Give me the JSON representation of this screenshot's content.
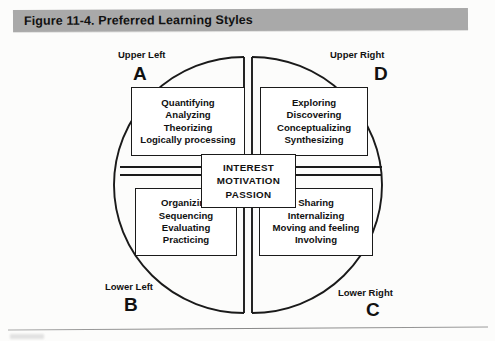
{
  "figure": {
    "title": "Figure 11-4. Preferred Learning Styles",
    "banner_color": "#a9a9a9",
    "background_color": "#fcfcfb",
    "ink_color": "#1a1a1a"
  },
  "diagram": {
    "type": "quadrant-circle",
    "shape": "circle divided into four quadrants by a double-line cross",
    "center": {
      "name": "center-box",
      "lines": [
        "INTEREST",
        "MOTIVATION",
        "PASSION"
      ]
    },
    "quadrants": [
      {
        "id": "A",
        "position": "upper-left",
        "position_label": "Upper Left",
        "letter": "A",
        "lines": [
          "Quantifying",
          "Analyzing",
          "Theorizing",
          "Logically processing"
        ]
      },
      {
        "id": "D",
        "position": "upper-right",
        "position_label": "Upper Right",
        "letter": "D",
        "lines": [
          "Exploring",
          "Discovering",
          "Conceptualizing",
          "Synthesizing"
        ]
      },
      {
        "id": "B",
        "position": "lower-left",
        "position_label": "Lower Left",
        "letter": "B",
        "lines": [
          "Organizing",
          "Sequencing",
          "Evaluating",
          "Practicing"
        ]
      },
      {
        "id": "C",
        "position": "lower-right",
        "position_label": "Lower Right",
        "letter": "C",
        "lines": [
          "Sharing",
          "Internalizing",
          "Moving and feeling",
          "Involving"
        ]
      }
    ]
  }
}
